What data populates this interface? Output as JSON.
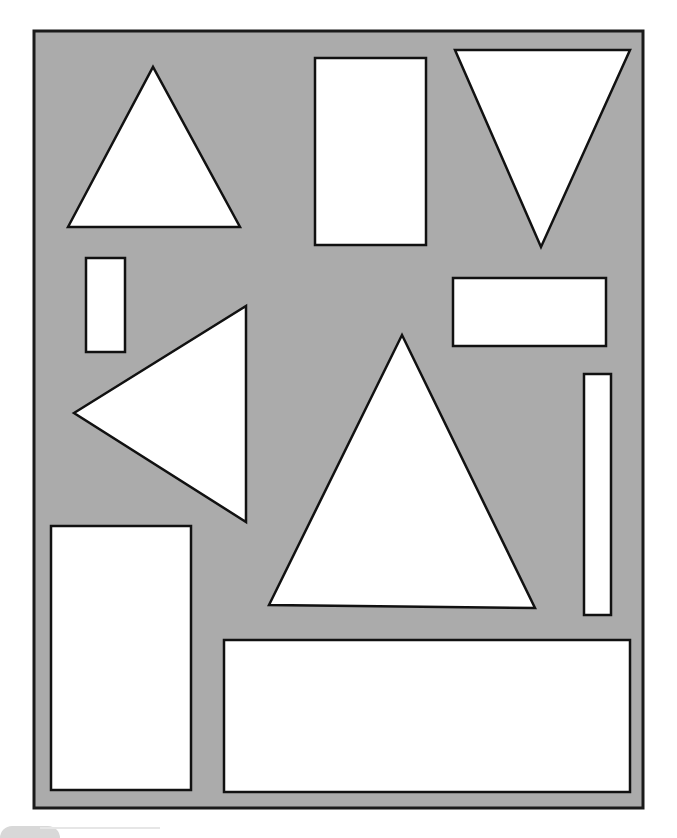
{
  "diagram": {
    "title": "",
    "canvas": {
      "width": 677,
      "height": 835
    },
    "colors": {
      "frame_fill": "#ababab",
      "frame_stroke": "#1a1a1a",
      "shape_fill": "#ffffff",
      "shape_stroke": "#111111"
    },
    "frame": {
      "x": 34,
      "y": 31,
      "width": 609,
      "height": 777
    },
    "shapes": [
      {
        "id": "triangle-up-small",
        "type": "triangle",
        "points": "68,227 153,67 240,227"
      },
      {
        "id": "rect-tall-top",
        "type": "rectangle",
        "x": 315,
        "y": 58,
        "width": 111,
        "height": 187
      },
      {
        "id": "triangle-down",
        "type": "triangle",
        "points": "455,50 630,50 541,247"
      },
      {
        "id": "rect-small-vertical",
        "type": "rectangle",
        "x": 86,
        "y": 258,
        "width": 39,
        "height": 94
      },
      {
        "id": "rect-wide-right",
        "type": "rectangle",
        "x": 453,
        "y": 278,
        "width": 153,
        "height": 68
      },
      {
        "id": "triangle-left",
        "type": "triangle",
        "points": "74,413 246,306 246,522"
      },
      {
        "id": "triangle-up-large",
        "type": "triangle",
        "points": "269,605 402,335 535,608"
      },
      {
        "id": "rect-thin-vertical",
        "type": "rectangle",
        "x": 584,
        "y": 374,
        "width": 27,
        "height": 241
      },
      {
        "id": "rect-tall-bottom-left",
        "type": "rectangle",
        "x": 51,
        "y": 526,
        "width": 140,
        "height": 264
      },
      {
        "id": "rect-wide-bottom",
        "type": "rectangle",
        "x": 224,
        "y": 640,
        "width": 406,
        "height": 152
      }
    ]
  }
}
